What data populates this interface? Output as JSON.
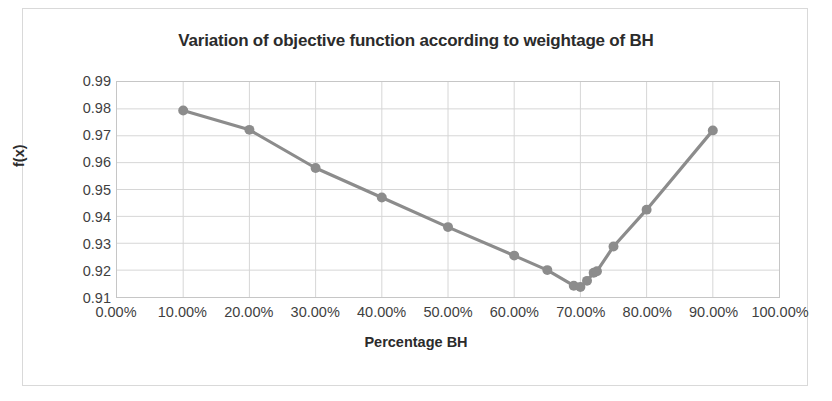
{
  "chart_data": {
    "type": "line",
    "title": "Variation of objective function according to weightage of BH",
    "xlabel": "Percentage BH",
    "ylabel": "f(x)",
    "xlim": [
      0,
      1.0
    ],
    "ylim": [
      0.91,
      0.99
    ],
    "grid": true,
    "legend": false,
    "series_color": "#8c8c8c",
    "marker": "circle",
    "x_tick_labels": [
      "0.00%",
      "10.00%",
      "20.00%",
      "30.00%",
      "40.00%",
      "50.00%",
      "60.00%",
      "70.00%",
      "80.00%",
      "90.00%",
      "100.00%"
    ],
    "x_tick_values": [
      0,
      0.1,
      0.2,
      0.3,
      0.4,
      0.5,
      0.6,
      0.7,
      0.8,
      0.9,
      1.0
    ],
    "y_tick_labels": [
      "0.99",
      "0.98",
      "0.97",
      "0.96",
      "0.95",
      "0.94",
      "0.93",
      "0.92",
      "0.91"
    ],
    "y_tick_values": [
      0.99,
      0.98,
      0.97,
      0.96,
      0.95,
      0.94,
      0.93,
      0.92,
      0.91
    ],
    "x": [
      0.1,
      0.2,
      0.3,
      0.4,
      0.5,
      0.6,
      0.65,
      0.69,
      0.7,
      0.71,
      0.72,
      0.725,
      0.75,
      0.8,
      0.9
    ],
    "y": [
      0.9794,
      0.9722,
      0.958,
      0.947,
      0.936,
      0.9254,
      0.92,
      0.9142,
      0.9137,
      0.916,
      0.919,
      0.9196,
      0.9288,
      0.9425,
      0.972
    ],
    "points": [
      {
        "x": 0.1,
        "y": 0.9794
      },
      {
        "x": 0.2,
        "y": 0.9722
      },
      {
        "x": 0.3,
        "y": 0.958
      },
      {
        "x": 0.4,
        "y": 0.947
      },
      {
        "x": 0.5,
        "y": 0.936
      },
      {
        "x": 0.6,
        "y": 0.9254
      },
      {
        "x": 0.65,
        "y": 0.92
      },
      {
        "x": 0.69,
        "y": 0.9142
      },
      {
        "x": 0.7,
        "y": 0.9137
      },
      {
        "x": 0.71,
        "y": 0.916
      },
      {
        "x": 0.72,
        "y": 0.919
      },
      {
        "x": 0.725,
        "y": 0.9196
      },
      {
        "x": 0.75,
        "y": 0.9288
      },
      {
        "x": 0.8,
        "y": 0.9425
      },
      {
        "x": 0.9,
        "y": 0.972
      }
    ]
  },
  "colors": {
    "line": "#8c8c8c",
    "grid": "#d6d6d6",
    "axis": "#c6c6c6",
    "text": "#3f3f3f",
    "title": "#2b2b2b",
    "frame": "#d9d9d9",
    "background": "#ffffff"
  }
}
